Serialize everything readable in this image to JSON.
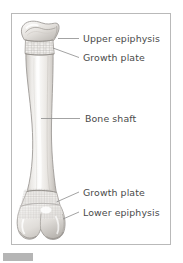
{
  "figure": {
    "frame": {
      "stroke": "#b9b9b9"
    },
    "palette": {
      "bone_light": "#f4f3f1",
      "bone_mid": "#dedbd7",
      "bone_shadow": "#b9b5b0",
      "outline": "#9a9692",
      "spongy": "#cfccc7",
      "text": "#4a4a4a",
      "leader": "#8c8c8c",
      "chip": "#b5b5b5",
      "background": "#ffffff"
    }
  },
  "labels": [
    {
      "id": "upper-epiphysis",
      "text": "Upper epiphysis",
      "x": 83,
      "y": 34,
      "leader": "horizontal"
    },
    {
      "id": "growth-plate-top",
      "text": "Growth plate",
      "x": 83,
      "y": 53,
      "leader": "diagonal-up"
    },
    {
      "id": "bone-shaft",
      "text": "Bone shaft",
      "x": 85,
      "y": 114,
      "leader": "horizontal"
    },
    {
      "id": "growth-plate-bottom",
      "text": "Growth plate",
      "x": 83,
      "y": 188,
      "leader": "diagonal-down"
    },
    {
      "id": "lower-epiphysis",
      "text": "Lower epiphysis",
      "x": 83,
      "y": 208,
      "leader": "diagonal-down"
    }
  ],
  "parts": [
    {
      "id": "upper-epiphysis",
      "name": "Upper epiphysis",
      "region": "proximal rounded head"
    },
    {
      "id": "growth-plate-top",
      "name": "Growth plate",
      "region": "proximal epiphyseal plate"
    },
    {
      "id": "bone-shaft",
      "name": "Bone shaft",
      "region": "diaphysis"
    },
    {
      "id": "growth-plate-bottom",
      "name": "Growth plate",
      "region": "distal epiphyseal plate"
    },
    {
      "id": "lower-epiphysis",
      "name": "Lower epiphysis",
      "region": "distal condyles"
    }
  ],
  "footer": {
    "chip_label": ""
  }
}
